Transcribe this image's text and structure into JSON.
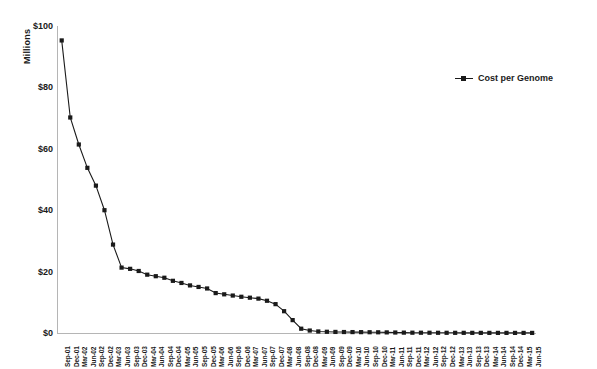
{
  "chart_data": {
    "type": "line",
    "title": "",
    "subtitle": "",
    "xlabel": "",
    "ylabel": "",
    "y_unit_label": "Millions",
    "ylim": [
      0,
      100
    ],
    "yticks": [
      0,
      20,
      40,
      60,
      80,
      100
    ],
    "ytick_labels": [
      "$0",
      "$20",
      "$40",
      "$60",
      "$80",
      "$100"
    ],
    "grid": false,
    "legend_position": "top-right",
    "legend": [
      "Cost per Genome"
    ],
    "marker": "square",
    "series_color": "#1a1a1a",
    "categories": [
      "Sep-01",
      "Dec-01",
      "Mar-02",
      "Jun-02",
      "Sep-02",
      "Dec-02",
      "Mar-03",
      "Jun-03",
      "Sep-03",
      "Dec-03",
      "Mar-04",
      "Jun-04",
      "Sep-04",
      "Dec-04",
      "Mar-05",
      "Jun-05",
      "Sep-05",
      "Dec-05",
      "Mar-06",
      "Jun-06",
      "Sep-06",
      "Dec-06",
      "Mar-07",
      "Jun-07",
      "Sep-07",
      "Dec-07",
      "Mar-08",
      "Jun-08",
      "Sep-08",
      "Dec-08",
      "Mar-09",
      "Jun-09",
      "Sep-09",
      "Dec-09",
      "Mar-10",
      "Jun-10",
      "Sep-10",
      "Dec-10",
      "Mar-11",
      "Jun-11",
      "Sep-11",
      "Dec-11",
      "Mar-12",
      "Jun-12",
      "Sep-12",
      "Dec-12",
      "Mar-13",
      "Jun-13",
      "Sep-13",
      "Dec-13",
      "Mar-14",
      "Jun-14",
      "Sep-14",
      "Dec-14",
      "Mar-15",
      "Jun-15"
    ],
    "series": [
      {
        "name": "Cost per Genome",
        "values": [
          95.3,
          70.2,
          61.4,
          53.8,
          48.0,
          40.0,
          28.8,
          21.3,
          20.9,
          20.2,
          19.0,
          18.5,
          18.0,
          17.0,
          16.3,
          15.5,
          15.0,
          14.5,
          13.0,
          12.6,
          12.2,
          11.8,
          11.5,
          11.2,
          10.5,
          9.4,
          7.1,
          4.2,
          1.4,
          0.8,
          0.5,
          0.4,
          0.35,
          0.32,
          0.3,
          0.28,
          0.25,
          0.23,
          0.2,
          0.16,
          0.12,
          0.1,
          0.09,
          0.08,
          0.07,
          0.065,
          0.06,
          0.055,
          0.05,
          0.045,
          0.042,
          0.04,
          0.038,
          0.035,
          0.033,
          0.03
        ]
      }
    ]
  }
}
